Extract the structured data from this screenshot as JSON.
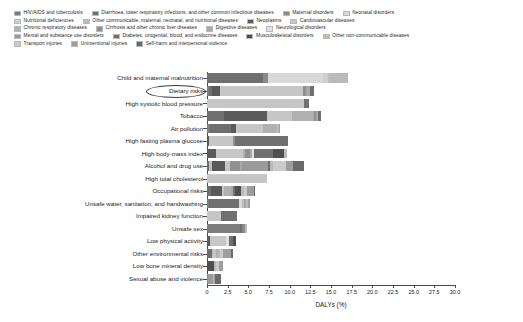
{
  "chart_data": {
    "type": "bar",
    "orientation": "horizontal",
    "stacked": true,
    "title": "",
    "xlabel": "DALYs (%)",
    "ylabel": "",
    "xlim": [
      0,
      30
    ],
    "xticks": [
      0,
      2.5,
      5.0,
      7.5,
      10.0,
      12.5,
      15.0,
      17.5,
      20.0,
      22.5,
      25.0,
      27.5,
      30.0
    ],
    "xtick_labels": [
      "0",
      "2.5",
      "5.0",
      "7.5",
      "10.0",
      "12.5",
      "15.0",
      "17.5",
      "20.0",
      "22.5",
      "25.0",
      "27.5",
      "30.0"
    ],
    "grid": false,
    "legend_position": "top",
    "annotation": "Dietary risks",
    "categories": [
      "Child and maternal malnutrition",
      "Dietary risks",
      "High systolic blood pressure",
      "Tobacco",
      "Air pollution",
      "High fasting plasma glucose",
      "High body-mass index",
      "Alcohol and drug use",
      "High total cholesterol",
      "Occupational risks",
      "Unsafe water, sanitation, and handwashing",
      "Impaired kidney function",
      "Unsafe sex",
      "Low physical activity",
      "Other environmental risks",
      "Low bone mineral density",
      "Sexual abuse and violence"
    ],
    "series": [
      {
        "name": "HIV/AIDS and tuberculosis",
        "color": "#7d7d7d",
        "values": [
          0,
          0.3,
          0,
          0,
          0.35,
          0,
          0,
          0,
          0,
          0,
          0.3,
          0,
          4.0,
          0,
          0,
          0,
          0
        ]
      },
      {
        "name": "Diarrhoea, lower respiratory infections, and other common infectious diseases",
        "color": "#6f6f6f",
        "values": [
          6.8,
          0.35,
          0,
          2.1,
          2.6,
          0,
          0,
          0.3,
          0,
          0.45,
          3.6,
          0,
          0.25,
          0,
          0.55,
          0,
          0
        ]
      },
      {
        "name": "Maternal disorders",
        "color": "#8a8a8a",
        "values": [
          0.55,
          0,
          0,
          0,
          0,
          0,
          0,
          0,
          0,
          0,
          0,
          0,
          0.35,
          0,
          0,
          0,
          0.15
        ]
      },
      {
        "name": "Neonatal disorders",
        "color": "#d8d8d8",
        "values": [
          6.7,
          0,
          0,
          0,
          0,
          0,
          0,
          0,
          0,
          0,
          0.35,
          0,
          0,
          0,
          0,
          0,
          0
        ]
      },
      {
        "name": "Nutritional deficiencies",
        "color": "#cfcfcf",
        "values": [
          0.55,
          0,
          0,
          0,
          0,
          0,
          0,
          0,
          0,
          0,
          0,
          0,
          0,
          0,
          0,
          0,
          0
        ]
      },
      {
        "name": "Other communicable, maternal, neonatal, and nutritional diseases",
        "color": "#bdbdbd",
        "values": [
          0.35,
          0,
          0,
          0,
          0,
          0,
          0,
          0.3,
          0,
          0,
          0.2,
          0,
          0.2,
          0,
          0.15,
          0,
          0
        ]
      },
      {
        "name": "Neoplasms",
        "color": "#5a5a5a",
        "values": [
          0,
          0.9,
          0,
          5.2,
          0.55,
          0.25,
          1.1,
          1.6,
          0,
          1.35,
          0,
          0,
          0,
          0.35,
          0,
          0,
          0
        ]
      },
      {
        "name": "Cardiovascular diseases",
        "color": "#c6c6c6",
        "values": [
          0,
          10.1,
          11.7,
          3.0,
          3.3,
          2.9,
          3.3,
          0.55,
          7.2,
          0.3,
          0,
          1.7,
          0,
          2.0,
          0.45,
          0,
          0
        ]
      },
      {
        "name": "Chronic respiratory diseases",
        "color": "#b0b0b0",
        "values": [
          0,
          0,
          0,
          2.6,
          1.5,
          0,
          0.25,
          0,
          0,
          0.8,
          0,
          0,
          0,
          0,
          0.15,
          0,
          0
        ]
      },
      {
        "name": "Cirrhosis and other chronic liver diseases",
        "color": "#909090",
        "values": [
          0,
          0.3,
          0,
          0.3,
          0,
          0.25,
          0.5,
          1.2,
          0,
          0,
          0,
          0,
          0,
          0,
          0,
          0,
          0
        ]
      },
      {
        "name": "Digestive diseases",
        "color": "#a8a8a8",
        "values": [
          0,
          0.55,
          0,
          0.25,
          0,
          0,
          0.25,
          0.25,
          0,
          0.3,
          0.25,
          0,
          0,
          0,
          0,
          0,
          0
        ]
      },
      {
        "name": "Neurological disorders",
        "color": "#e2e2e2",
        "values": [
          0,
          0,
          0,
          0,
          0,
          0,
          0.25,
          0,
          0,
          0,
          0,
          0,
          0,
          0.3,
          0,
          0,
          0
        ]
      },
      {
        "name": "Mental and substance use disorders",
        "color": "#9a9a9a",
        "values": [
          0,
          0,
          0,
          0,
          0,
          0,
          0,
          3.2,
          0,
          0,
          0,
          0,
          0,
          0,
          0,
          0,
          0.55
        ]
      },
      {
        "name": "Diabetes, urogenital, blood, and endocrine diseases",
        "color": "#707070",
        "values": [
          0,
          0.45,
          0.6,
          0.3,
          0,
          6.4,
          2.4,
          0.25,
          0,
          0.25,
          0,
          1.95,
          0,
          0.45,
          0,
          0,
          0
        ]
      },
      {
        "name": "Musculoskeletal disorders",
        "color": "#4f4f4f",
        "values": [
          0,
          0,
          0,
          0,
          0,
          0,
          1.3,
          0,
          0,
          0.65,
          0,
          0,
          0,
          0.35,
          0,
          0.85,
          0
        ]
      },
      {
        "name": "Other non-communicable diseases",
        "color": "#bababa",
        "values": [
          2.1,
          0,
          0,
          0,
          0.4,
          0,
          0.3,
          0.3,
          0,
          0.35,
          0.25,
          0,
          0,
          0,
          0.3,
          0.25,
          0.15
        ]
      },
      {
        "name": "Transport injuries",
        "color": "#cacaca",
        "values": [
          0,
          0,
          0,
          0,
          0,
          0,
          0,
          1.6,
          0,
          0.45,
          0,
          0,
          0,
          0,
          0.35,
          0.3,
          0
        ]
      },
      {
        "name": "Unintentional injuries",
        "color": "#9e9e9e",
        "values": [
          0,
          0,
          0,
          0,
          0.15,
          0,
          0,
          0.85,
          0,
          0.75,
          0.2,
          0,
          0,
          0,
          0.95,
          0.55,
          0.15
        ]
      },
      {
        "name": "Self-harm and interpersonal violence",
        "color": "#6a6a6a",
        "values": [
          0,
          0,
          0,
          0,
          0,
          0,
          0,
          1.3,
          0,
          0.2,
          0,
          0,
          0,
          0,
          0.2,
          0,
          0.75
        ]
      }
    ],
    "totals": [
      17.05,
      12.95,
      12.3,
      13.75,
      8.85,
      9.8,
      9.65,
      11.7,
      7.2,
      5.85,
      5.15,
      3.65,
      4.8,
      3.45,
      3.3,
      1.95,
      1.75
    ]
  },
  "legend": {
    "rows": [
      [
        {
          "label": "HIV/AIDS and tuberculosis",
          "color": "#7d7d7d"
        },
        {
          "label": "Diarrhoea, lower respiratory infections, and other common infectious diseases",
          "color": "#6f6f6f"
        },
        {
          "label": "Maternal disorders",
          "color": "#8a8a8a"
        },
        {
          "label": "Neonatal disorders",
          "color": "#d8d8d8"
        }
      ],
      [
        {
          "label": "Nutritional deficiencies",
          "color": "#cfcfcf"
        },
        {
          "label": "Other communicable, maternal, neonatal, and nutritional diseases",
          "color": "#bdbdbd"
        },
        {
          "label": "Neoplasms",
          "color": "#5a5a5a"
        },
        {
          "label": "Cardiovascular diseases",
          "color": "#c6c6c6"
        }
      ],
      [
        {
          "label": "Chronic respiratory diseases",
          "color": "#b0b0b0"
        },
        {
          "label": "Cirrhosis and other chronic liver diseases",
          "color": "#909090"
        },
        {
          "label": "Digestive diseases",
          "color": "#a8a8a8"
        },
        {
          "label": "Neurological disorders",
          "color": "#e2e2e2"
        }
      ],
      [
        {
          "label": "Mental and substance use disorders",
          "color": "#9a9a9a"
        },
        {
          "label": "Diabetes, urogenital, blood, and endocrine diseases",
          "color": "#707070"
        },
        {
          "label": "Musculoskeletal disorders",
          "color": "#4f4f4f"
        },
        {
          "label": "Other non-communicable diseases",
          "color": "#bababa"
        }
      ],
      [
        {
          "label": "Transport injuries",
          "color": "#cacaca"
        },
        {
          "label": "Unintentional injuries",
          "color": "#9e9e9e"
        },
        {
          "label": "Self-harm and interpersonal violence",
          "color": "#6a6a6a"
        }
      ]
    ]
  }
}
